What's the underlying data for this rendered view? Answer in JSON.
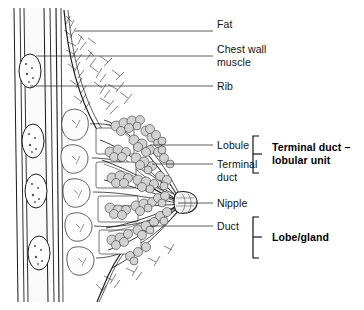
{
  "figure": {
    "background_color": "#ffffff",
    "line_color": "#1a1a1a",
    "leader_color": "#333333",
    "lobule_fill": "#d2d2d2",
    "tissue_fill": "#fbfbfb",
    "muscle_fill": "#f2f2f2",
    "rib_fill": "#fdfdfd"
  },
  "labels": [
    {
      "id": "fat",
      "text": "Fat",
      "x": 217,
      "y": 24,
      "leader_y": 31,
      "leader_x1": 199,
      "leader_x2": 213,
      "anchor_x": 75,
      "anchor_y": 31
    },
    {
      "id": "chest-wall-muscle",
      "text": "Chest wall\nmuscle",
      "x": 217,
      "y": 49,
      "leader_y": 56,
      "leader_x1": 199,
      "leader_x2": 213,
      "anchor_x": 36,
      "anchor_y": 56
    },
    {
      "id": "rib",
      "text": "Rib",
      "x": 217,
      "y": 80,
      "leader_y": 86,
      "leader_x1": 199,
      "leader_x2": 213,
      "anchor_x": 30,
      "anchor_y": 86
    },
    {
      "id": "lobule",
      "text": "Lobule",
      "x": 217,
      "y": 138,
      "leader_y": 145,
      "leader_x1": 199,
      "leader_x2": 213,
      "anchor_x": 150,
      "anchor_y": 145
    },
    {
      "id": "terminal-duct",
      "text": "Terminal\nduct",
      "x": 217,
      "y": 157,
      "leader_y": 164,
      "leader_x1": 199,
      "leader_x2": 213,
      "anchor_x": 152,
      "anchor_y": 164
    },
    {
      "id": "nipple",
      "text": "Nipple",
      "x": 217,
      "y": 196,
      "leader_y": 203,
      "leader_x1": 199,
      "leader_x2": 213,
      "anchor_x": 178,
      "anchor_y": 203
    },
    {
      "id": "duct",
      "text": "Duct",
      "x": 217,
      "y": 219,
      "leader_y": 226,
      "leader_x1": 199,
      "leader_x2": 213,
      "anchor_x": 150,
      "anchor_y": 226
    }
  ],
  "groups": [
    {
      "id": "terminal-duct-lobular-unit",
      "text": "Terminal duct –\nlobular unit",
      "bracket_x": 253,
      "bracket_top": 136,
      "bracket_bottom": 173,
      "bracket_tip_y": 154,
      "text_x": 272,
      "text_y": 148
    },
    {
      "id": "lobe-gland",
      "text": "Lobe/gland",
      "bracket_x": 253,
      "bracket_top": 217,
      "bracket_bottom": 258,
      "bracket_tip_y": 237,
      "text_x": 272,
      "text_y": 231
    }
  ],
  "structures": {
    "rib_count": 4,
    "rib_positions_y": [
      70,
      140,
      185,
      255
    ],
    "lobule_cluster_count": 14,
    "duct_count": 8
  }
}
